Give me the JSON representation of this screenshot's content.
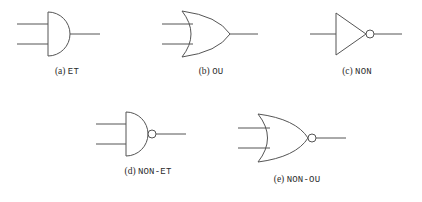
{
  "figure": {
    "background_color": "#ffffff",
    "stroke_color": "#555555",
    "caption_color": "#2b2b2b",
    "gates": [
      {
        "id": "and",
        "index_label": "(a)",
        "name_label": "ET",
        "symbol": "and-gate",
        "inputs": 2,
        "inverted_output": false,
        "row": 1
      },
      {
        "id": "or",
        "index_label": "(b)",
        "name_label": "OU",
        "symbol": "or-gate",
        "inputs": 2,
        "inverted_output": false,
        "row": 1
      },
      {
        "id": "not",
        "index_label": "(c)",
        "name_label": "NON",
        "symbol": "not-gate",
        "inputs": 1,
        "inverted_output": true,
        "row": 1
      },
      {
        "id": "nand",
        "index_label": "(d)",
        "name_label": "NON-ET",
        "symbol": "nand-gate",
        "inputs": 2,
        "inverted_output": true,
        "row": 2
      },
      {
        "id": "nor",
        "index_label": "(e)",
        "name_label": "NON-OU",
        "symbol": "nor-gate",
        "inputs": 2,
        "inverted_output": true,
        "row": 2
      }
    ]
  }
}
